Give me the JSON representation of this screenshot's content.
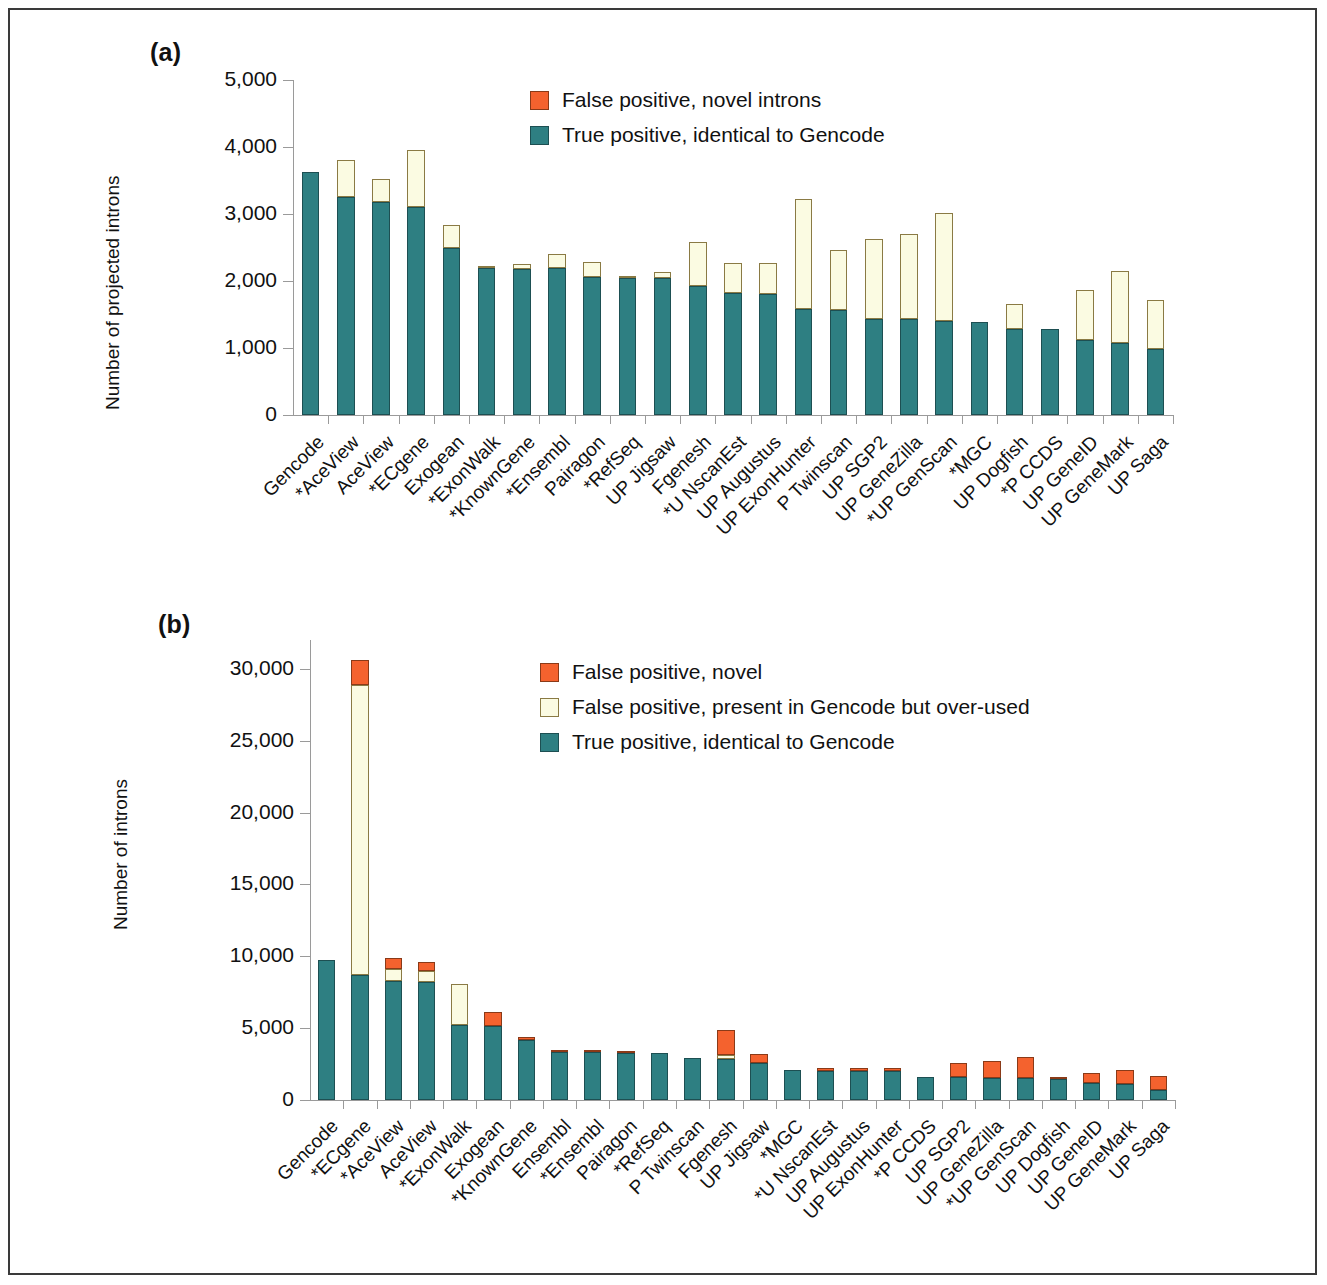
{
  "figure": {
    "panel_a_letter": "(a)",
    "panel_b_letter": "(b)"
  },
  "colors": {
    "true_positive": "#2e7f82",
    "false_positive_novel": "#f4622e",
    "false_positive_overused": "#fbfbe2",
    "axis": "#9a9a9a",
    "text": "#111111",
    "frame": "#3a3a3a"
  },
  "panel_a": {
    "legend": [
      {
        "label": "False positive, novel introns",
        "color_key": "false_positive_novel"
      },
      {
        "label": "True positive, identical to Gencode",
        "color_key": "true_positive"
      }
    ],
    "chart_data": {
      "type": "bar",
      "stacked": true,
      "title": "",
      "xlabel": "",
      "ylabel": "Number of projected introns",
      "ylim": [
        0,
        5000
      ],
      "yticks": [
        0,
        1000,
        2000,
        3000,
        4000,
        5000
      ],
      "ytick_labels": [
        "0",
        "1,000",
        "2,000",
        "3,000",
        "4,000",
        "5,000"
      ],
      "grid": false,
      "legend_position": "top-center",
      "categories": [
        "Gencode",
        "*AceView",
        "AceView",
        "*ECgene",
        "Exogean",
        "*ExonWalk",
        "*KnownGene",
        "*Ensembl",
        "Pairagon",
        "*RefSeq",
        "UP Jigsaw",
        "Fgenesh",
        "*U NscanEst",
        "UP Augustus",
        "UP ExonHunter",
        "P Twinscan",
        "UP SGP2",
        "UP GeneZilla",
        "*UP GenScan",
        "*MGC",
        "UP Dogfish",
        "*P CCDS",
        "UP GeneID",
        "UP GeneMark",
        "UP Saga"
      ],
      "series": [
        {
          "name": "True positive, identical to Gencode",
          "values": [
            3620,
            3260,
            3180,
            3100,
            2500,
            2190,
            2180,
            2190,
            2060,
            2040,
            2040,
            1920,
            1820,
            1800,
            1580,
            1570,
            1430,
            1430,
            1400,
            1390,
            1290,
            1290,
            1120,
            1080,
            990
          ]
        },
        {
          "name": "False positive, novel introns",
          "values": [
            0,
            540,
            340,
            850,
            340,
            10,
            80,
            220,
            220,
            20,
            100,
            660,
            450,
            470,
            1640,
            900,
            1190,
            1270,
            1620,
            0,
            360,
            0,
            750,
            1070,
            720
          ]
        }
      ],
      "totals": [
        3620,
        3800,
        3520,
        3950,
        2840,
        2200,
        2260,
        2410,
        2280,
        2060,
        2140,
        2580,
        2270,
        2270,
        3220,
        2470,
        2620,
        2700,
        3020,
        1390,
        1650,
        1290,
        1870,
        2150,
        1710
      ]
    }
  },
  "panel_b": {
    "legend": [
      {
        "label": "False positive, novel",
        "color_key": "false_positive_novel"
      },
      {
        "label": "False positive, present in Gencode but over-used",
        "color_key": "false_positive_overused"
      },
      {
        "label": "True positive, identical to Gencode",
        "color_key": "true_positive"
      }
    ],
    "chart_data": {
      "type": "bar",
      "stacked": true,
      "title": "",
      "xlabel": "",
      "ylabel": "Number of introns",
      "ylim": [
        0,
        32000
      ],
      "yticks": [
        0,
        5000,
        10000,
        15000,
        20000,
        25000,
        30000
      ],
      "ytick_labels": [
        "0",
        "5,000",
        "10,000",
        "15,000",
        "20,000",
        "25,000",
        "30,000"
      ],
      "grid": false,
      "legend_position": "top-center",
      "categories": [
        "Gencode",
        "*ECgene",
        "*AceView",
        "AceView",
        "*ExonWalk",
        "Exogean",
        "*KnownGene",
        "Ensembl",
        "*Ensembl",
        "Pairagon",
        "*RefSeq",
        "P Twinscan",
        "Fgenesh",
        "UP Jigsaw",
        "*MGC",
        "*U NscanEst",
        "UP Augustus",
        "UP ExonHunter",
        "*P CCDS",
        "UP SGP2",
        "UP GeneZilla",
        "*UP GenScan",
        "UP Dogfish",
        "UP GeneID",
        "UP GeneMark",
        "UP Saga"
      ],
      "series": [
        {
          "name": "True positive, identical to Gencode",
          "values": [
            9750,
            8700,
            8250,
            8200,
            5200,
            5150,
            4200,
            3350,
            3350,
            3300,
            3250,
            2900,
            2850,
            2600,
            2100,
            2000,
            2000,
            2000,
            1600,
            1600,
            1550,
            1500,
            1450,
            1150,
            1100,
            700
          ]
        },
        {
          "name": "False positive, present in Gencode but over-used",
          "values": [
            0,
            20200,
            850,
            800,
            2900,
            0,
            0,
            0,
            0,
            0,
            0,
            0,
            300,
            0,
            0,
            0,
            0,
            0,
            0,
            0,
            0,
            0,
            0,
            0,
            0,
            0
          ]
        },
        {
          "name": "False positive, novel",
          "values": [
            0,
            1700,
            800,
            600,
            0,
            950,
            150,
            150,
            150,
            100,
            0,
            0,
            1700,
            600,
            0,
            200,
            200,
            200,
            0,
            1000,
            1150,
            1500,
            100,
            700,
            1000,
            1000
          ]
        }
      ],
      "totals": [
        9750,
        30600,
        9900,
        9600,
        8100,
        6100,
        4350,
        3500,
        3500,
        3400,
        3250,
        2900,
        4850,
        3200,
        2100,
        2200,
        2200,
        2200,
        1600,
        2600,
        2700,
        3000,
        1550,
        1850,
        2100,
        1700
      ]
    }
  }
}
